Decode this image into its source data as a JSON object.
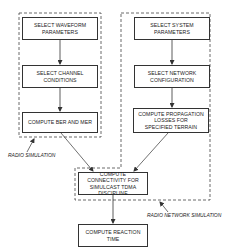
{
  "diagram": {
    "type": "flowchart",
    "groups": [
      {
        "id": "radio-simulation",
        "label": "RADIO SIMULATION",
        "style": "dashed"
      },
      {
        "id": "radio-network-simulation",
        "label": "RADIO NETWORK SIMULATION",
        "style": "dashed"
      }
    ],
    "nodes": [
      {
        "id": "n1",
        "group": "radio-simulation",
        "text": "SELECT WAVEFORM\nPARAMETERS"
      },
      {
        "id": "n2",
        "group": "radio-simulation",
        "text": "SELECT CHANNEL\nCONDITIONS"
      },
      {
        "id": "n3",
        "group": "radio-simulation",
        "text": "COMPUTE BER AND MER"
      },
      {
        "id": "n4",
        "group": "radio-network-simulation",
        "text": "SELECT SYSTEM\nPARAMETERS"
      },
      {
        "id": "n5",
        "group": "radio-network-simulation",
        "text": "SELECT NETWORK\nCONFIGURATION"
      },
      {
        "id": "n6",
        "group": "radio-network-simulation",
        "text": "COMPUTE PROPAGATION\nLOSSES FOR\nSPECIFIED TERRAIN"
      },
      {
        "id": "n7",
        "group": "radio-network-simulation",
        "text": "COMPUTE CONNECTIVITY FOR\nSIMULCAST TDMA DISCIPLINE"
      },
      {
        "id": "n8",
        "group": null,
        "text": "COMPUTE REACTION TIME"
      }
    ],
    "edges": [
      {
        "from": "n1",
        "to": "n2"
      },
      {
        "from": "n2",
        "to": "n3"
      },
      {
        "from": "n4",
        "to": "n5"
      },
      {
        "from": "n5",
        "to": "n6"
      },
      {
        "from": "n3",
        "to": "n7"
      },
      {
        "from": "n6",
        "to": "n7"
      },
      {
        "from": "n7",
        "to": "n8"
      }
    ],
    "colors": {
      "line": "#333333",
      "background": "#ffffff",
      "text": "#222222"
    }
  }
}
